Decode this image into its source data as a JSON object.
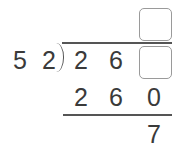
{
  "division": {
    "divisor": [
      "5",
      "2"
    ],
    "dividend": [
      "2",
      "6"
    ],
    "quotient_boxes": 1,
    "dividend_boxes": 1,
    "product": [
      "2",
      "6",
      "0"
    ],
    "remainder": [
      "7"
    ]
  },
  "colors": {
    "text": "#3a3a3a",
    "box_border": "#9a9a9a",
    "line": "#555555"
  }
}
